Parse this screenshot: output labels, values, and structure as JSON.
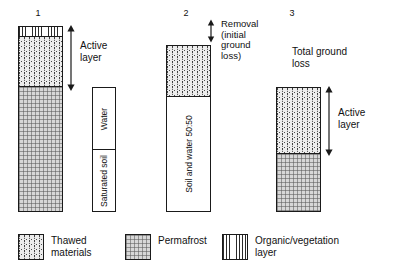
{
  "figure": {
    "type": "diagram"
  },
  "columns": [
    {
      "number": "1",
      "bands": [
        {
          "label": "",
          "material": "organic-vegetation"
        },
        {
          "label": "",
          "material": "thawed-materials"
        },
        {
          "label": "",
          "material": "permafrost"
        }
      ]
    },
    {
      "number": "2",
      "bands": [
        {
          "label": "",
          "material": "thawed-materials"
        },
        {
          "label": "Soil and water 50:50",
          "material": "plain"
        }
      ]
    },
    {
      "number": "3",
      "bands": [
        {
          "label": "",
          "material": "thawed-materials"
        },
        {
          "label": "",
          "material": "permafrost"
        }
      ]
    }
  ],
  "phase_bar": {
    "top_label": "Water",
    "bottom_label": "Saturated soil"
  },
  "annotations": {
    "active_layer_1": "Active\nlayer",
    "removal": "Removal\n(initial\nground\nloss)",
    "total_ground_loss": "Total  ground\nloss",
    "active_layer_3": "Active\nlayer"
  },
  "legend": {
    "items": [
      {
        "label": "Thawed\nmaterials",
        "pattern": "stipple"
      },
      {
        "label": "Permafrost",
        "pattern": "grid-hatch"
      },
      {
        "label": "Organic/vegetation\nlayer",
        "pattern": "vertical-lines"
      }
    ]
  },
  "colors": {
    "outline": "#1a1a1a",
    "text": "#111111",
    "thawed_fill": "#ececec",
    "permafrost_fill": "#d7d7d7",
    "background": "#ffffff"
  }
}
